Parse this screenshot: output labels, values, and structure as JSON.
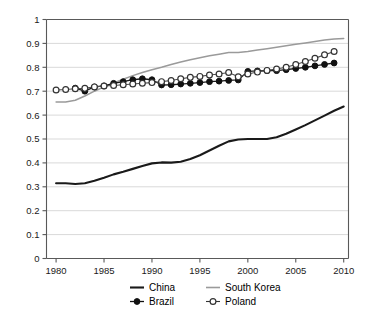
{
  "chart_data": {
    "type": "line",
    "title": "",
    "subtitle": "",
    "xlabel": "",
    "ylabel": "",
    "xlim": [
      1979,
      2010.5
    ],
    "ylim": [
      0,
      1
    ],
    "grid": true,
    "legend_position": "bottom",
    "x_ticks": [
      "1980",
      "1985",
      "1990",
      "1995",
      "2000",
      "2005",
      "2010"
    ],
    "x_tick_values": [
      1980,
      1985,
      1990,
      1995,
      2000,
      2005,
      2010
    ],
    "y_ticks": [
      "0",
      "0.1",
      "0.2",
      "0.3",
      "0.4",
      "0.5",
      "0.6",
      "0.7",
      "0.8",
      "0.9",
      "1"
    ],
    "y_tick_values": [
      0,
      0.1,
      0.2,
      0.3,
      0.4,
      0.5,
      0.6,
      0.7,
      0.8,
      0.9,
      1
    ],
    "series": [
      {
        "name": "China",
        "style": "line",
        "color": "#1a1a1a",
        "marker": "none",
        "x": [
          1980,
          1981,
          1982,
          1983,
          1984,
          1985,
          1986,
          1987,
          1988,
          1989,
          1990,
          1991,
          1992,
          1993,
          1994,
          1995,
          1996,
          1997,
          1998,
          1999,
          2000,
          2001,
          2002,
          2003,
          2004,
          2005,
          2006,
          2007,
          2008,
          2009,
          2010
        ],
        "values": [
          0.315,
          0.315,
          0.312,
          0.315,
          0.325,
          0.338,
          0.352,
          0.363,
          0.375,
          0.387,
          0.398,
          0.402,
          0.401,
          0.405,
          0.416,
          0.432,
          0.452,
          0.472,
          0.49,
          0.498,
          0.5,
          0.5,
          0.5,
          0.507,
          0.522,
          0.54,
          0.558,
          0.578,
          0.598,
          0.618,
          0.636
        ]
      },
      {
        "name": "South Korea",
        "style": "line",
        "color": "#9a9a9a",
        "marker": "none",
        "x": [
          1980,
          1981,
          1982,
          1983,
          1984,
          1985,
          1986,
          1987,
          1988,
          1989,
          1990,
          1991,
          1992,
          1993,
          1994,
          1995,
          1996,
          1997,
          1998,
          1999,
          2000,
          2001,
          2002,
          2003,
          2004,
          2005,
          2006,
          2007,
          2008,
          2009,
          2010
        ],
        "values": [
          0.655,
          0.655,
          0.662,
          0.68,
          0.7,
          0.718,
          0.735,
          0.75,
          0.765,
          0.778,
          0.79,
          0.8,
          0.812,
          0.822,
          0.832,
          0.84,
          0.848,
          0.855,
          0.862,
          0.862,
          0.866,
          0.872,
          0.878,
          0.884,
          0.89,
          0.896,
          0.902,
          0.908,
          0.914,
          0.918,
          0.92
        ]
      },
      {
        "name": "Brazil",
        "style": "line-marker",
        "color": "#111111",
        "marker": "filled-circle",
        "x": [
          1982,
          1983,
          1984,
          1985,
          1986,
          1987,
          1988,
          1989,
          1990,
          1991,
          1992,
          1993,
          1994,
          1995,
          1996,
          1997,
          1998,
          1999,
          2000,
          2001,
          2002,
          2003,
          2004,
          2005,
          2006,
          2007,
          2008,
          2009
        ],
        "values": [
          0.713,
          0.7,
          0.718,
          0.722,
          0.733,
          0.74,
          0.748,
          0.752,
          0.748,
          0.726,
          0.727,
          0.73,
          0.733,
          0.736,
          0.74,
          0.742,
          0.745,
          0.747,
          0.783,
          0.785,
          0.786,
          0.786,
          0.79,
          0.795,
          0.8,
          0.806,
          0.812,
          0.818
        ]
      },
      {
        "name": "Poland",
        "style": "line-marker",
        "color": "#333333",
        "marker": "open-circle",
        "x": [
          1980,
          1981,
          1982,
          1983,
          1984,
          1985,
          1986,
          1987,
          1988,
          1989,
          1990,
          1991,
          1992,
          1993,
          1994,
          1995,
          1996,
          1997,
          1998,
          1999,
          2000,
          2001,
          2002,
          2003,
          2004,
          2005,
          2006,
          2007,
          2008,
          2009
        ],
        "values": [
          0.705,
          0.707,
          0.71,
          0.712,
          0.718,
          0.722,
          0.724,
          0.727,
          0.73,
          0.733,
          0.736,
          0.74,
          0.745,
          0.752,
          0.758,
          0.762,
          0.768,
          0.772,
          0.778,
          0.76,
          0.772,
          0.78,
          0.787,
          0.793,
          0.8,
          0.812,
          0.824,
          0.838,
          0.852,
          0.866
        ]
      }
    ]
  },
  "legend": {
    "items": [
      {
        "label": "China",
        "marker": "line",
        "color": "#1a1a1a"
      },
      {
        "label": "South Korea",
        "marker": "line",
        "color": "#9a9a9a"
      },
      {
        "label": "Brazil",
        "marker": "filled-circle",
        "color": "#111111"
      },
      {
        "label": "Poland",
        "marker": "open-circle",
        "color": "#333333"
      }
    ]
  }
}
